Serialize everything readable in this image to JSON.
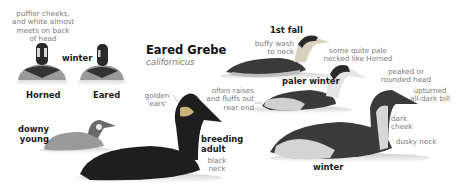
{
  "title": "Eared Grebe",
  "scientific_name": "californicus",
  "comparison": {
    "note": [
      "puffier cheeks,",
      "and white almost",
      "meets on back",
      "of head"
    ],
    "season": "winter",
    "left_label": "Horned",
    "right_label": "Eared"
  },
  "plumages": {
    "first_fall": "1st fall",
    "paler_winter": "paler winter",
    "winter": "winter",
    "downy_young": [
      "downy",
      "young"
    ],
    "breeding_adult": [
      "breeding",
      "adult"
    ]
  },
  "annotations": {
    "buffy_wash": [
      "buffy wash",
      "to neck"
    ],
    "pale_necked": [
      "some quite pale",
      "necked like Horned"
    ],
    "peaked_head": [
      "peaked or",
      "rounded head"
    ],
    "upturned_bill": [
      "upturned",
      "all-dark bill"
    ],
    "fluffs_rear": [
      "often raises",
      "and fluffs out",
      "rear end"
    ],
    "golden_ears": [
      "golden",
      "'ears'"
    ],
    "black_neck": [
      "black",
      "neck"
    ],
    "dark_cheek": [
      "dark",
      "cheek"
    ],
    "dusky_neck": "dusky neck"
  },
  "colors": {
    "ink": "#1a1a1a",
    "label": "#7a7a7a",
    "bird_dark": "#222222",
    "bird_mid": "#8a8a8a",
    "bird_light": "#e6e6e6"
  }
}
